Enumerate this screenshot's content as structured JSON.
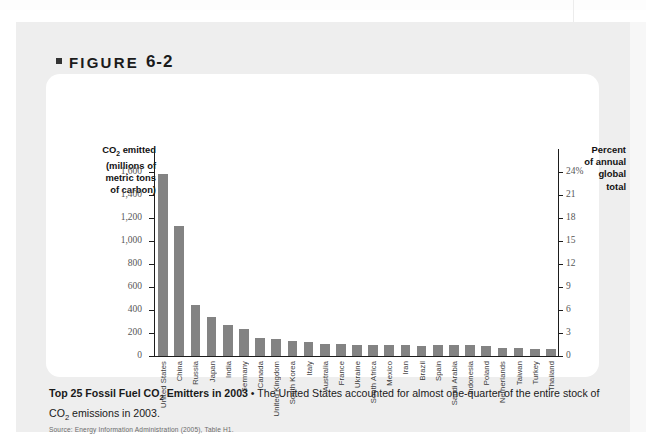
{
  "figure": {
    "label_prefix": "FIGURE",
    "number": "6-2"
  },
  "axis": {
    "left_title": "CO2 emitted (millions of metric tons of carbon)",
    "left_title_lines": [
      "CO",
      "2",
      " emitted",
      "(millions of",
      "metric tons",
      "of carbon)"
    ],
    "right_title_lines": [
      "Percent",
      "of annual",
      "global",
      "total"
    ],
    "left_ticks": [
      "1,600",
      "1,400",
      "1,200",
      "1,000",
      "800",
      "600",
      "400",
      "200",
      "0"
    ],
    "right_ticks": [
      "24%",
      "21",
      "18",
      "15",
      "12",
      "9",
      "6",
      "3",
      "0"
    ]
  },
  "caption": {
    "bold_part": "Top 25 Fossil Fuel CO",
    "bold_sub": "2",
    "bold_rest": " Emitters in 2003",
    "separator": " • ",
    "body_1": "The United States accounted for almost one-quarter of the entire stock of CO",
    "body_sub": "2",
    "body_2": " emissions in 2003.",
    "source": "Source: Energy Information Administration (2005), Table H1."
  },
  "colors": {
    "bar": "#838383",
    "panel": "#ffffff",
    "block": "#eeeeee",
    "axis": "#1d1d1d",
    "tick_text": "#565656"
  },
  "chart_data": {
    "type": "bar",
    "title": "Top 25 Fossil Fuel CO2 Emitters in 2003",
    "xlabel": "",
    "ylabel": "CO2 emitted (millions of metric tons of carbon)",
    "y2label": "Percent of annual global total",
    "ylim": [
      0,
      1800
    ],
    "y2lim": [
      0,
      27
    ],
    "yticks": [
      0,
      200,
      400,
      600,
      800,
      1000,
      1200,
      1400,
      1600
    ],
    "y2ticks": [
      0,
      3,
      6,
      9,
      12,
      15,
      18,
      21,
      24
    ],
    "grid": false,
    "legend": false,
    "categories": [
      "United States",
      "China",
      "Russia",
      "Japan",
      "India",
      "Germany",
      "Canada",
      "United Kingdom",
      "South Korea",
      "Italy",
      "Australia",
      "France",
      "Ukraine",
      "South Africa",
      "Mexico",
      "Iran",
      "Brazil",
      "Spain",
      "Saudi Arabia",
      "Indonesia",
      "Poland",
      "Netherlands",
      "Taiwan",
      "Turkey",
      "Thailand"
    ],
    "values": [
      1580,
      1131,
      440,
      336,
      274,
      231,
      154,
      152,
      130,
      126,
      107,
      105,
      92,
      98,
      99,
      97,
      90,
      95,
      94,
      95,
      83,
      73,
      73,
      60,
      57
    ],
    "percent_values": [
      23.7,
      17.0,
      6.6,
      5.0,
      4.1,
      3.5,
      2.3,
      2.3,
      2.0,
      1.9,
      1.6,
      1.6,
      1.4,
      1.5,
      1.5,
      1.5,
      1.4,
      1.4,
      1.4,
      1.4,
      1.2,
      1.1,
      1.1,
      0.9,
      0.9
    ],
    "units": "millions of metric tons of carbon"
  }
}
